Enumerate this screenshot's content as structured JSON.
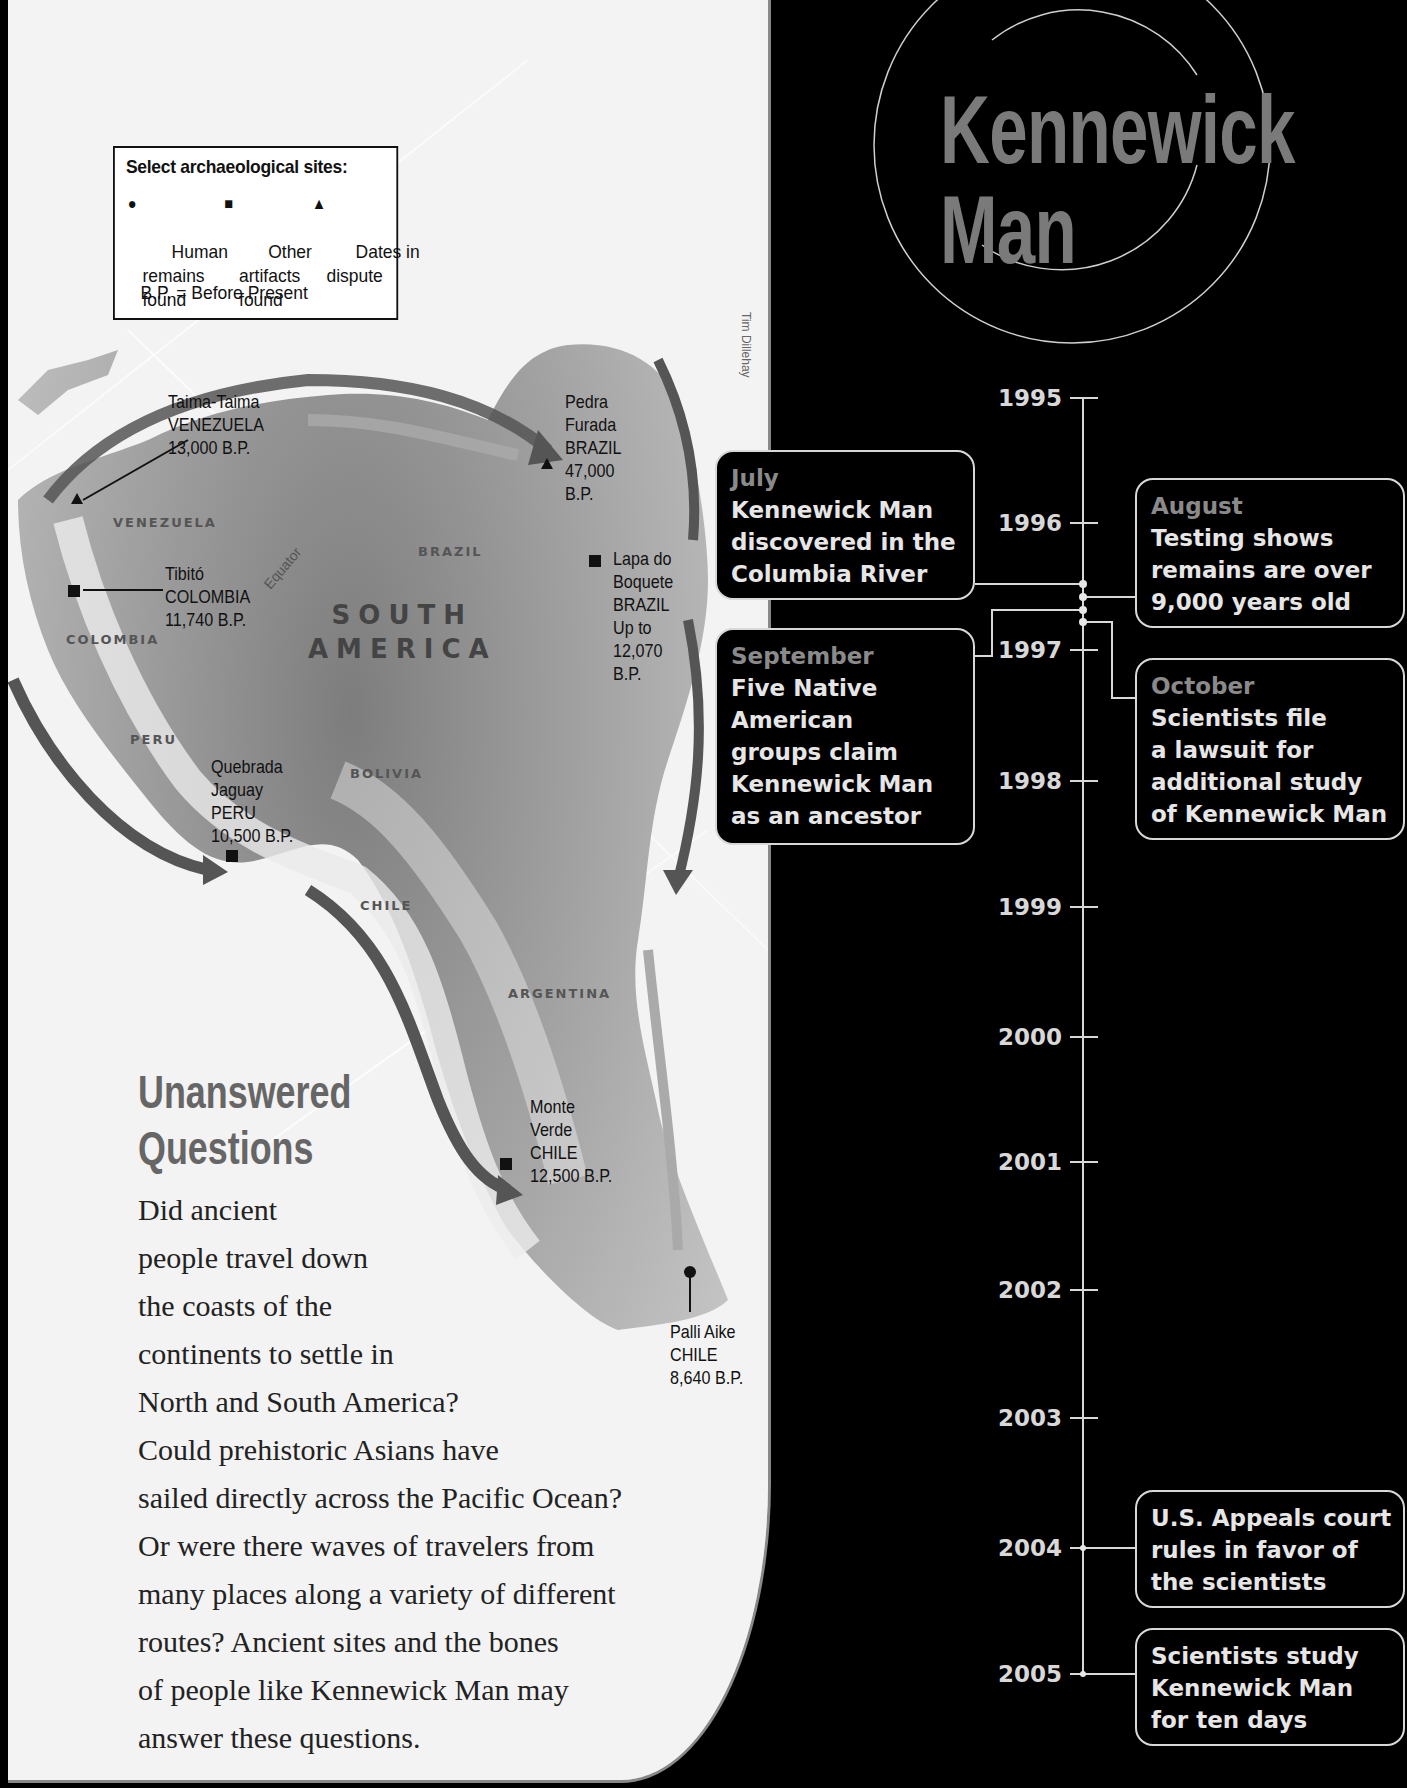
{
  "map": {
    "legend": {
      "title": "Select archaeological sites:",
      "items": [
        {
          "symbol": "●",
          "icon": "circle-icon",
          "label": "Human\nremains\nfound"
        },
        {
          "symbol": "■",
          "icon": "square-icon",
          "label": "Other\nartifacts\nfound"
        },
        {
          "symbol": "▲",
          "icon": "triangle-icon",
          "label": "Dates in\ndispute"
        }
      ],
      "footnote": "B.P. = Before Present"
    },
    "credit": "Tim Dillehay",
    "continent_label": "SOUTH\nAMERICA",
    "equator_label": "Equator",
    "countries": {
      "venezuela": "VENEZUELA",
      "colombia": "COLOMBIA",
      "brazil": "BRAZIL",
      "peru": "PERU",
      "bolivia": "BOLIVIA",
      "chile": "CHILE",
      "argentina": "ARGENTINA"
    },
    "sites": [
      {
        "name": "Taima-Taima",
        "country": "VENEZUELA",
        "date": "13,000 B.P.",
        "type": "dates-in-dispute"
      },
      {
        "name": "Pedra Furada",
        "country": "BRAZIL",
        "date": "47,000 B.P.",
        "type": "dates-in-dispute"
      },
      {
        "name": "Tibitó",
        "country": "COLOMBIA",
        "date": "11,740 B.P.",
        "type": "other-artifacts"
      },
      {
        "name": "Lapa do Boquete",
        "country": "BRAZIL",
        "date": "Up to 12,070 B.P.",
        "type": "other-artifacts"
      },
      {
        "name": "Quebrada Jaguay",
        "country": "PERU",
        "date": "10,500 B.P.",
        "type": "other-artifacts"
      },
      {
        "name": "Monte Verde",
        "country": "CHILE",
        "date": "12,500 B.P.",
        "type": "other-artifacts"
      },
      {
        "name": "Palli Aike",
        "country": "CHILE",
        "date": "8,640 B.P.",
        "type": "human-remains"
      }
    ],
    "site_labels": {
      "taima": "Taima-Taima\nVENEZUELA\n13,000 B.P.",
      "pedra": "Pedra\nFurada\nBRAZIL\n47,000\nB.P.",
      "tibito": "Tibitó\nCOLOMBIA\n11,740 B.P.",
      "lapa": "Lapa do\nBoquete\nBRAZIL\nUp to\n12,070\nB.P.",
      "quebrada": "Quebrada\nJaguay\nPERU\n10,500 B.P.",
      "monte": "Monte\nVerde\nCHILE\n12,500 B.P.",
      "palli": "Palli Aike\nCHILE\n8,640 B.P."
    }
  },
  "questions": {
    "title_line1": "Unanswered",
    "title_line2": "Questions",
    "lines": [
      "Did ancient",
      "people travel down",
      "the coasts of the",
      "continents to settle in",
      "North and South America?",
      "Could prehistoric Asians have",
      "sailed directly across the Pacific Ocean?",
      "Or were there waves of travelers from",
      "many places along a variety of different",
      "routes? Ancient sites and the bones",
      "of people like Kennewick Man may",
      "answer these questions."
    ]
  },
  "timeline": {
    "title_line1": "Kennewick",
    "title_line2": "Man",
    "years": [
      "1995",
      "1996",
      "1997",
      "1998",
      "1999",
      "2000",
      "2001",
      "2002",
      "2003",
      "2004",
      "2005"
    ],
    "events": [
      {
        "month": "July",
        "text": "Kennewick Man\ndiscovered in the\nColumbia River"
      },
      {
        "month": "August",
        "text": "Testing shows\nremains are over\n9,000 years old"
      },
      {
        "month": "September",
        "text": "Five Native\nAmerican\ngroups claim\nKennewick Man\nas an ancestor"
      },
      {
        "month": "October",
        "text": "Scientists file\na lawsuit for\nadditional study\nof Kennewick Man"
      },
      {
        "month": "",
        "text": "U.S. Appeals court\nrules in favor of\nthe scientists"
      },
      {
        "month": "",
        "text": "Scientists study\nKennewick Man\nfor ten days"
      }
    ],
    "colors": {
      "background": "#000000",
      "line": "#d8d8d8",
      "month": "#8a8a8a",
      "title": "#7a7a7a"
    }
  }
}
